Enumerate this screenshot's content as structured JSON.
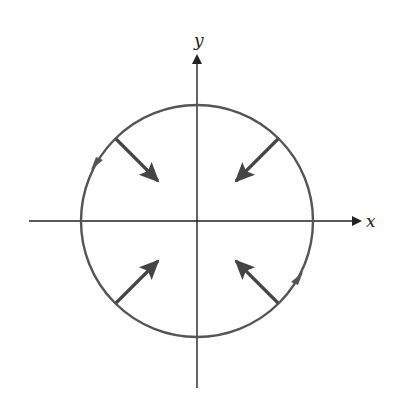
{
  "diagram": {
    "type": "vector-field-on-circle",
    "axes": {
      "x_label": "x",
      "y_label": "y",
      "origin": [
        197,
        221
      ],
      "x_axis": {
        "from": 29,
        "to": 362
      },
      "y_axis": {
        "from": 388,
        "to": 54
      }
    },
    "circle": {
      "center": [
        197,
        221
      ],
      "radius": 116,
      "orientation": "counterclockwise",
      "color": "#555555"
    },
    "inward_arrows": [
      {
        "quadrant": "upper-left",
        "from": [
          115,
          138
        ],
        "to": [
          158,
          181
        ]
      },
      {
        "quadrant": "upper-right",
        "from": [
          279,
          138
        ],
        "to": [
          236,
          181
        ]
      },
      {
        "quadrant": "lower-left",
        "from": [
          115,
          304
        ],
        "to": [
          158,
          261
        ]
      },
      {
        "quadrant": "lower-right",
        "from": [
          279,
          304
        ],
        "to": [
          236,
          261
        ]
      }
    ],
    "orientation_markers": [
      {
        "position": "upper-left",
        "direction": "down-left"
      },
      {
        "position": "lower-right",
        "direction": "up-right"
      }
    ],
    "colors": {
      "axes": "#222222",
      "circle": "#555555",
      "arrows": "#444444"
    }
  }
}
